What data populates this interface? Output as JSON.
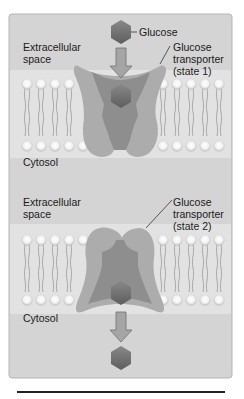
{
  "figure": {
    "panel_top": {
      "glucose_label": "Glucose",
      "extracellular_label": "Extracellular\nspace",
      "transporter_label": "Glucose\ntransporter\n(state 1)",
      "cytosol_label": "Cytosol"
    },
    "panel_bottom": {
      "extracellular_label": "Extracellular\nspace",
      "transporter_label": "Glucose\ntransporter\n(state 2)",
      "cytosol_label": "Cytosol"
    },
    "colors": {
      "panel_bg": "#d4d4d4",
      "membrane_band": "#e6e6e6",
      "transporter_light": "#a9a9a9",
      "transporter_dark": "#8a8a8a",
      "glucose": "#6f6f6f",
      "arrow": "#9a9a9a"
    }
  }
}
